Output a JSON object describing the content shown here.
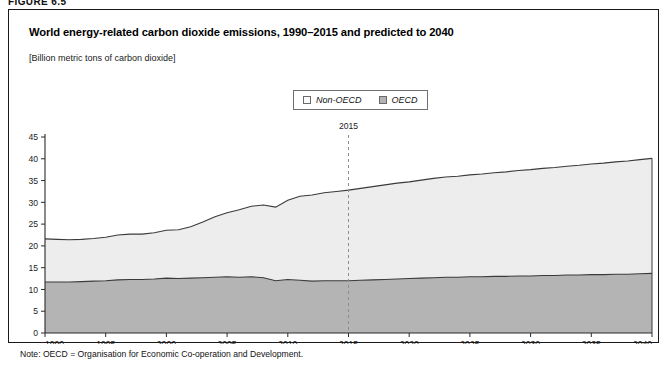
{
  "figure": {
    "label": "FIGURE 6.5",
    "title": "World energy-related carbon dioxide emissions, 1990–2015 and predicted to 2040",
    "subtitle": "[Billion metric tons of carbon dioxide]",
    "note": "Note: OECD = Organisation for Economic Co-operation and Development."
  },
  "legend": {
    "position": "top-center",
    "items": [
      {
        "label": "Non-OECD",
        "color": "#ededed"
      },
      {
        "label": "OECD",
        "color": "#b4b4b4"
      }
    ]
  },
  "annotation": {
    "label": "2015",
    "x_value": 2015,
    "style": "dashed-vertical-line"
  },
  "chart_data": {
    "type": "area",
    "stacked": true,
    "title": "World energy-related carbon dioxide emissions, 1990–2015 and predicted to 2040",
    "xlabel": "",
    "ylabel": "",
    "unit": "Billion metric tons of carbon dioxide",
    "grid": false,
    "xlim": [
      1990,
      2040
    ],
    "ylim": [
      0,
      45
    ],
    "ytick_labels": [
      "0",
      "5",
      "10",
      "15",
      "20",
      "25",
      "30",
      "35",
      "40",
      "45"
    ],
    "yticks": [
      0,
      5,
      10,
      15,
      20,
      25,
      30,
      35,
      40,
      45
    ],
    "xtick_labels": [
      "1990",
      "1995",
      "2000",
      "2005",
      "2010",
      "2015",
      "2020",
      "2025",
      "2030",
      "2035",
      "2040"
    ],
    "xticks": [
      1990,
      1995,
      2000,
      2005,
      2010,
      2015,
      2020,
      2025,
      2030,
      2035,
      2040
    ],
    "x": [
      1990,
      1991,
      1992,
      1993,
      1994,
      1995,
      1996,
      1997,
      1998,
      1999,
      2000,
      2001,
      2002,
      2003,
      2004,
      2005,
      2006,
      2007,
      2008,
      2009,
      2010,
      2011,
      2012,
      2013,
      2014,
      2015,
      2016,
      2017,
      2018,
      2019,
      2020,
      2021,
      2022,
      2023,
      2024,
      2025,
      2026,
      2027,
      2028,
      2029,
      2030,
      2031,
      2032,
      2033,
      2034,
      2035,
      2036,
      2037,
      2038,
      2039,
      2040
    ],
    "series": [
      {
        "name": "OECD",
        "color": "#b4b4b4",
        "values": [
          11.7,
          11.7,
          11.7,
          11.8,
          11.9,
          12.0,
          12.2,
          12.3,
          12.3,
          12.4,
          12.6,
          12.5,
          12.6,
          12.7,
          12.8,
          12.9,
          12.8,
          12.9,
          12.7,
          12.0,
          12.3,
          12.1,
          11.9,
          12.0,
          12.0,
          12.0,
          12.1,
          12.2,
          12.3,
          12.4,
          12.5,
          12.6,
          12.7,
          12.8,
          12.8,
          12.9,
          12.9,
          13.0,
          13.0,
          13.1,
          13.1,
          13.2,
          13.2,
          13.3,
          13.3,
          13.4,
          13.4,
          13.5,
          13.5,
          13.6,
          13.7
        ]
      },
      {
        "name": "Non-OECD",
        "color": "#ededed",
        "values": [
          9.9,
          9.8,
          9.7,
          9.7,
          9.8,
          10.0,
          10.3,
          10.4,
          10.4,
          10.6,
          11.0,
          11.2,
          11.8,
          12.8,
          13.9,
          14.7,
          15.5,
          16.2,
          16.7,
          16.9,
          18.2,
          19.3,
          19.8,
          20.2,
          20.5,
          20.8,
          21.1,
          21.4,
          21.7,
          22.0,
          22.2,
          22.5,
          22.8,
          23.0,
          23.2,
          23.4,
          23.6,
          23.8,
          24.0,
          24.2,
          24.4,
          24.6,
          24.8,
          25.0,
          25.2,
          25.4,
          25.6,
          25.8,
          26.0,
          26.2,
          26.4
        ]
      }
    ],
    "totals": [
      21.6,
      21.5,
      21.4,
      21.5,
      21.7,
      22.0,
      22.5,
      22.7,
      22.7,
      23.0,
      23.6,
      23.7,
      24.4,
      25.5,
      26.7,
      27.6,
      28.3,
      29.1,
      29.4,
      28.9,
      30.5,
      31.4,
      31.7,
      32.2,
      32.5,
      32.8,
      33.2,
      33.6,
      34.0,
      34.4,
      34.7,
      35.1,
      35.5,
      35.8,
      36.0,
      36.3,
      36.5,
      36.8,
      37.0,
      37.3,
      37.5,
      37.8,
      38.0,
      38.3,
      38.5,
      38.8,
      39.0,
      39.3,
      39.5,
      39.8,
      40.1
    ]
  }
}
